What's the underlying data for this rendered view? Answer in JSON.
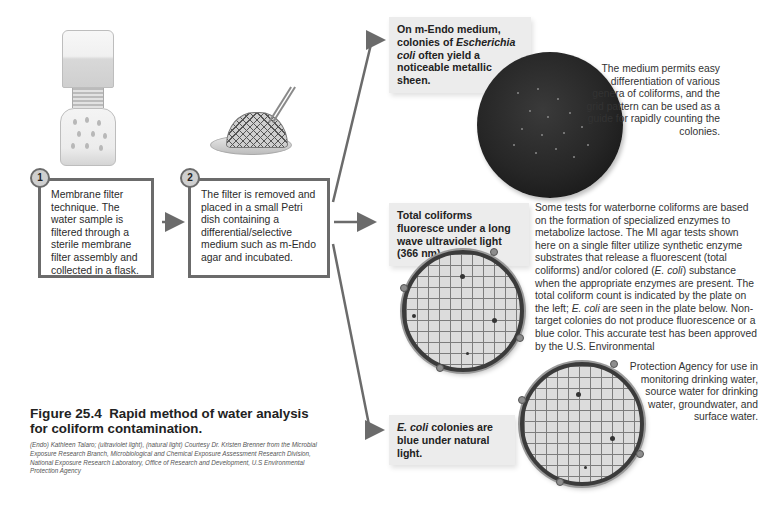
{
  "figure": {
    "number": "Figure 25.4",
    "title": "Rapid method of water analysis for coliform contamination.",
    "credit": "(Endo) Kathleen Talaro; (ultraviolet light), (natural light) Courtesy Dr. Kristen Brenner from the Microbial Exposure Research Branch, Microbiological and Chemical Exposure Assessment Research Division, National Exposure Research Laboratory, Office of Research and Development, U.S Environmental Protection Agency"
  },
  "steps": [
    {
      "number": "1",
      "text": "Membrane filter technique. The water sample is filtered through a sterile membrane filter assembly and collected in a flask."
    },
    {
      "number": "2",
      "text": "The filter is removed and placed in a small Petri dish containing a differential/selective medium such as m-Endo agar and incubated."
    }
  ],
  "callouts": {
    "endo": {
      "pre": "On m-Endo medium, colonies of ",
      "italic": "Escherichia coli",
      "post": " often yield a noticeable metallic sheen."
    },
    "uv": {
      "text": "Total coliforms fluoresce under a long wave ultraviolet light (366 nm)."
    },
    "natural": {
      "italic": "E. coli",
      "post": " colonies are blue under natural light."
    }
  },
  "descriptions": {
    "endo": "The medium permits easy differentiation of various genera of coliforms, and the grid pattern can be used as a guide for rapidly counting the colonies.",
    "mi_part1": "Some tests for waterborne coliforms are based on the formation of specialized enzymes to metabolize lactose. The MI agar tests shown here on a single filter utilize synthetic enzyme substrates that release a fluorescent (total coliforms) and/or colored (",
    "mi_italic1": "E. coli",
    "mi_part2": ") substance when the appropriate enzymes are present. The total coliform count is indicated by the plate on the left; ",
    "mi_italic2": "E. coli",
    "mi_part3": " are seen in the plate below. Non-target colonies do not produce fluorescence or a blue color. This accurate test has been approved by the U.S. Environmental",
    "mi_tail": "Protection Agency for use in monitoring drinking water, source water for drinking water, groundwater, and surface water."
  },
  "illustrations": {
    "flask": "membrane-filter-assembly",
    "filter_dish": "filter-on-petri-dish-with-forceps",
    "endo_plate": "m-endo-plate-metallic-sheen",
    "uv_plate": "mi-agar-plate-uv-light",
    "natural_plate": "mi-agar-plate-natural-light"
  },
  "colors": {
    "border": "#6b6b6b",
    "callout_bg": "#ececec",
    "arrow": "#6b6b6b"
  }
}
